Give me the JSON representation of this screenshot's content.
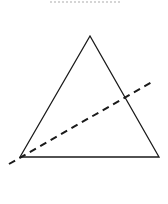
{
  "diagram": {
    "type": "geometry",
    "colors": {
      "background": "#ffffff",
      "stroke": "#1a1a1a",
      "top_dots": "#c8c8c8"
    },
    "top_dotted_line": {
      "x1": 50,
      "y1": 2,
      "x2": 120,
      "y2": 2
    },
    "triangle": {
      "apex": [
        90,
        36
      ],
      "bottom_left": [
        20,
        157
      ],
      "bottom_right": [
        159,
        157
      ]
    },
    "dashed_line": {
      "x1": 9,
      "y1": 164,
      "x2": 152,
      "y2": 82
    }
  }
}
